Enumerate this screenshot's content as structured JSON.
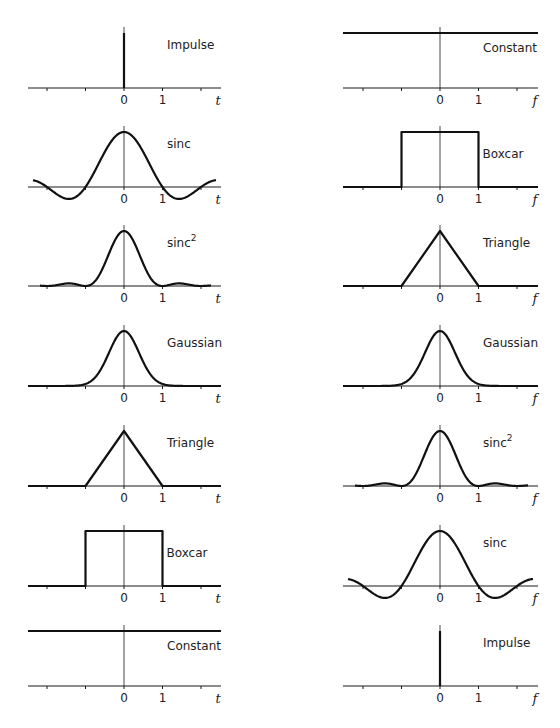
{
  "left_column": {
    "domain_variable": "t",
    "panels": [
      {
        "name": "Impulse",
        "shape": "impulse"
      },
      {
        "name": "sinc",
        "shape": "sinc"
      },
      {
        "name": "sinc",
        "superscript": "2",
        "shape": "sinc2"
      },
      {
        "name": "Gaussian",
        "shape": "gaussian"
      },
      {
        "name": "Triangle",
        "shape": "triangle"
      },
      {
        "name": "Boxcar",
        "shape": "boxcar"
      },
      {
        "name": "Constant",
        "shape": "constant"
      }
    ]
  },
  "right_column": {
    "domain_variable": "f",
    "panels": [
      {
        "name": "Constant",
        "shape": "constant"
      },
      {
        "name": "Boxcar",
        "shape": "boxcar"
      },
      {
        "name": "Triangle",
        "shape": "triangle"
      },
      {
        "name": "Gaussian",
        "shape": "gaussian"
      },
      {
        "name": "sinc",
        "superscript": "2",
        "shape": "sinc2"
      },
      {
        "name": "sinc",
        "shape": "sinc"
      },
      {
        "name": "Impulse",
        "shape": "impulse"
      }
    ]
  },
  "tick_labels": [
    "0",
    "1"
  ],
  "ticks": [
    -2,
    -1,
    0,
    1,
    2
  ],
  "x_range": [
    -2.5,
    2.5
  ],
  "colors": {
    "line": "#111111",
    "background": "#ffffff"
  },
  "chart_data": {
    "type": "line",
    "pairs": [
      {
        "time": "Impulse",
        "frequency": "Constant"
      },
      {
        "time": "sinc",
        "frequency": "Boxcar"
      },
      {
        "time": "sinc^2",
        "frequency": "Triangle"
      },
      {
        "time": "Gaussian",
        "frequency": "Gaussian"
      },
      {
        "time": "Triangle",
        "frequency": "sinc^2"
      },
      {
        "time": "Boxcar",
        "frequency": "sinc"
      },
      {
        "time": "Constant",
        "frequency": "Impulse"
      }
    ],
    "xlabel_left": "t",
    "xlabel_right": "f",
    "x_tick_labels": [
      "0",
      "1"
    ],
    "xlim": [
      -2.5,
      2.5
    ],
    "grid": false
  }
}
